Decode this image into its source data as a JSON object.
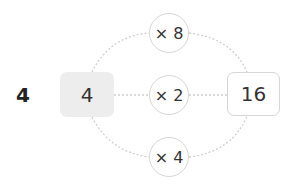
{
  "diagram": {
    "label": "4",
    "input_value": "4",
    "output_value": "16",
    "operations": [
      {
        "id": "top",
        "label": "× 8"
      },
      {
        "id": "middle",
        "label": "× 2"
      },
      {
        "id": "bottom",
        "label": "× 4"
      }
    ]
  },
  "colors": {
    "input_box_fill": "#ededed",
    "border": "#d6d6d6",
    "dotted_line": "#d0d0d0",
    "text": "#333333"
  }
}
